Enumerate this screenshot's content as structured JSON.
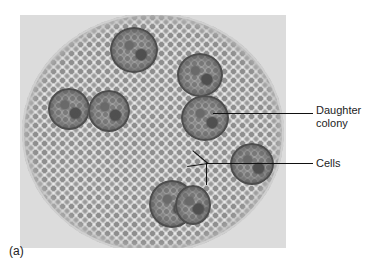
{
  "figure": {
    "caption_label": "(a)",
    "labels": {
      "daughter_colony_line1": "Daughter",
      "daughter_colony_line2": "colony",
      "cells": "Cells"
    }
  }
}
